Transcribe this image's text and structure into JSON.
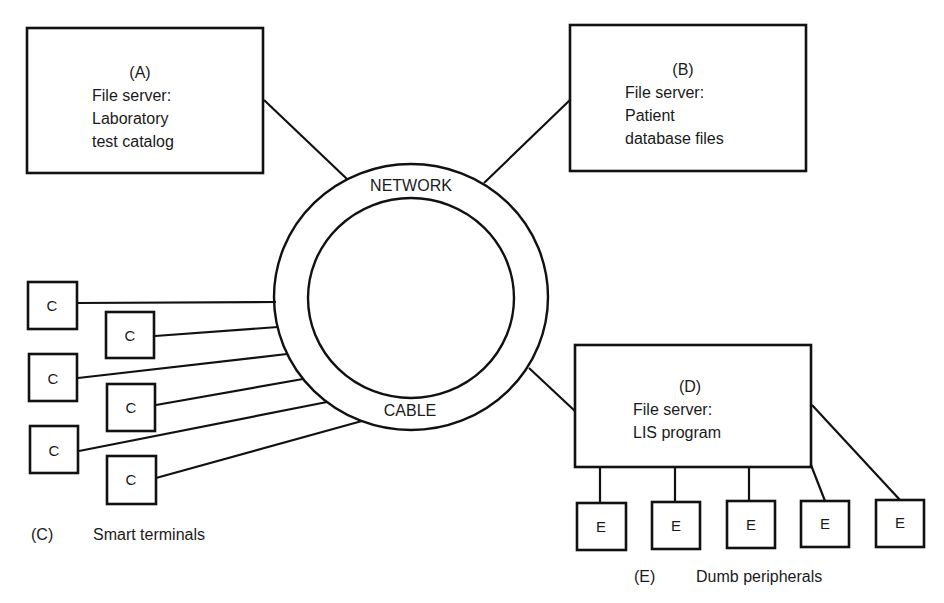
{
  "network": {
    "top_label": "NETWORK",
    "bottom_label": "CABLE"
  },
  "servers": {
    "a": {
      "id": "(A)",
      "lines": [
        "File server:",
        "Laboratory",
        "test catalog"
      ]
    },
    "b": {
      "id": "(B)",
      "lines": [
        "File server:",
        "Patient",
        "database files"
      ]
    },
    "d": {
      "id": "(D)",
      "lines": [
        "File server:",
        "LIS program"
      ]
    }
  },
  "smart_terminals": {
    "items": [
      "C",
      "C",
      "C",
      "C",
      "C",
      "C"
    ],
    "caption_id": "(C)",
    "caption_text": "Smart terminals"
  },
  "dumb_peripherals": {
    "items": [
      "E",
      "E",
      "E",
      "E",
      "E"
    ],
    "caption_id": "(E)",
    "caption_text": "Dumb peripherals"
  },
  "colors": {
    "stroke": "#111111",
    "background": "#ffffff"
  }
}
